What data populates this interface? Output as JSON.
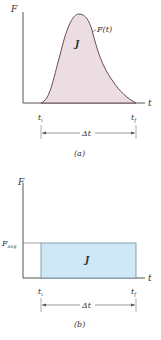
{
  "panel_a": {
    "y_axis_label": "F",
    "x_axis_label": "t",
    "area_label": "J",
    "curve_label": "F(t)",
    "start_label": "t",
    "start_sub": "i",
    "end_label": "t",
    "end_sub": "f",
    "interval_label": "Δt",
    "caption": "(a)",
    "fill_color": "#ecdde3",
    "stroke_color": "#6b4a57"
  },
  "panel_b": {
    "y_axis_label": "F",
    "x_axis_label": "t",
    "level_label": "F",
    "level_sub": "avg",
    "area_label": "J",
    "start_label": "t",
    "start_sub": "i",
    "end_label": "t",
    "end_sub": "f",
    "interval_label": "Δt",
    "caption": "(b)",
    "fill_color": "#cfe8f5",
    "stroke_color": "#6a8da0"
  }
}
